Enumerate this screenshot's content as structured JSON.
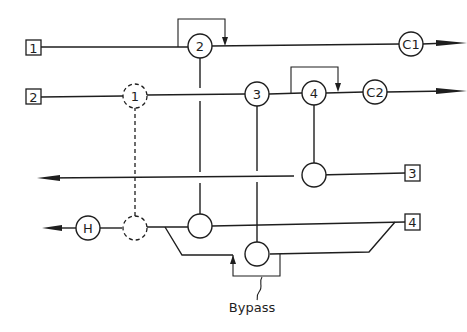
{
  "diagram": {
    "type": "process-flow-schematic",
    "stream_inputs": [
      {
        "id": "in1",
        "label": "1"
      },
      {
        "id": "in2",
        "label": "2"
      },
      {
        "id": "in3",
        "label": "3"
      },
      {
        "id": "in4",
        "label": "4"
      }
    ],
    "nodes": [
      {
        "id": "n2",
        "label": "2"
      },
      {
        "id": "n1",
        "label": "1",
        "style": "dashed"
      },
      {
        "id": "n3",
        "label": "3"
      },
      {
        "id": "n4",
        "label": "4"
      },
      {
        "id": "c1",
        "label": "C1"
      },
      {
        "id": "c2",
        "label": "C2"
      },
      {
        "id": "h",
        "label": "H"
      },
      {
        "id": "e3",
        "label": ""
      },
      {
        "id": "e4a",
        "label": ""
      },
      {
        "id": "e1d",
        "label": "",
        "style": "dashed"
      },
      {
        "id": "bypass_node",
        "label": ""
      }
    ],
    "annotations": {
      "bypass": "Bypass"
    },
    "colors": {
      "line": "#1e1e1e",
      "background": "#ffffff"
    }
  }
}
